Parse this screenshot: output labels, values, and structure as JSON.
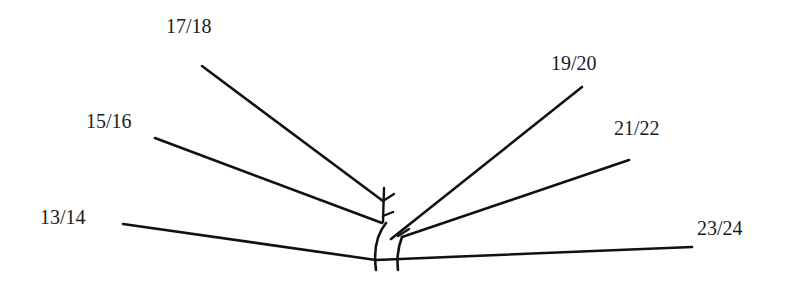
{
  "diagram": {
    "type": "branching-line-diagram",
    "stroke_color": "#111111",
    "background": "#ffffff",
    "labels": [
      {
        "id": "l1314",
        "text": "13/14",
        "x": 40,
        "y": 207
      },
      {
        "id": "l1516",
        "text": "15/16",
        "x": 86,
        "y": 111
      },
      {
        "id": "l1718",
        "text": "17/18",
        "x": 166,
        "y": 16
      },
      {
        "id": "l1920",
        "text": "19/20",
        "x": 551,
        "y": 53
      },
      {
        "id": "l2122",
        "text": "21/22",
        "x": 614,
        "y": 118
      },
      {
        "id": "l2324",
        "text": "23/24",
        "x": 697,
        "y": 218
      }
    ],
    "lines": [
      {
        "name": "branch-13-14",
        "x1": 123,
        "y1": 224,
        "x2": 376,
        "y2": 260
      },
      {
        "name": "branch-15-16",
        "x1": 155,
        "y1": 138,
        "x2": 382,
        "y2": 223
      },
      {
        "name": "branch-17-18",
        "x1": 202,
        "y1": 66,
        "x2": 383,
        "y2": 201
      },
      {
        "name": "branch-19-20",
        "x1": 582,
        "y1": 87,
        "x2": 391,
        "y2": 239
      },
      {
        "name": "branch-21-22",
        "x1": 629,
        "y1": 160,
        "x2": 402,
        "y2": 237
      },
      {
        "name": "branch-23-24",
        "x1": 692,
        "y1": 247,
        "x2": 376,
        "y2": 260
      }
    ],
    "tick_marks": [
      {
        "name": "tick-upper-left",
        "x1": 383,
        "y1": 201,
        "x2": 394,
        "y2": 194
      },
      {
        "name": "tick-upper-stem",
        "x1": 384,
        "y1": 188,
        "x2": 383,
        "y2": 222
      },
      {
        "name": "tick-lower-left",
        "x1": 383,
        "y1": 216,
        "x2": 393,
        "y2": 212
      },
      {
        "name": "tick-right-cross",
        "x1": 398,
        "y1": 236,
        "x2": 409,
        "y2": 229
      }
    ],
    "curves": [
      {
        "name": "left-arc",
        "d": "M 386 223 Q 372 240 376 270"
      },
      {
        "name": "right-arc",
        "d": "M 402 237 Q 396 252 398 270"
      }
    ]
  }
}
